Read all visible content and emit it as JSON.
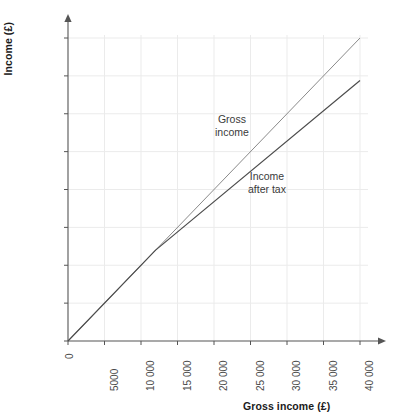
{
  "chart_data": {
    "type": "line",
    "title": "",
    "xlabel": "Gross income (£)",
    "ylabel": "Income (£)",
    "xlim": [
      0,
      40000
    ],
    "ylim": [
      0,
      40000
    ],
    "grid": true,
    "legend_position": "inline-annotation",
    "xticks": [
      0,
      5000,
      10000,
      15000,
      20000,
      25000,
      30000,
      35000,
      40000
    ],
    "xticklabels": [
      "0",
      "5000",
      "10 000",
      "15 000",
      "20 000",
      "25 000",
      "30 000",
      "35 000",
      "40 000"
    ],
    "yticks": [
      0,
      5000,
      10000,
      15000,
      20000,
      25000,
      30000,
      35000,
      40000
    ],
    "yticklabels": [
      "0",
      "5000",
      "10 000",
      "15 000",
      "20 000",
      "25 000",
      "30 000",
      "35 000",
      "40 000"
    ],
    "series": [
      {
        "name": "Gross income",
        "color": "#8a8a8a",
        "annotation": "Gross\nincome",
        "x": [
          0,
          40000
        ],
        "values": [
          0,
          40000
        ]
      },
      {
        "name": "Income after tax",
        "color": "#4d4d4d",
        "annotation": "Income\nafter tax",
        "x": [
          0,
          12000,
          40000
        ],
        "values": [
          0,
          12000,
          34400
        ]
      }
    ],
    "annotations": [
      {
        "text": "Gross\nincome",
        "x": 21000,
        "y": 26500
      },
      {
        "text": "Income\nafter tax",
        "x": 25500,
        "y": 20500
      }
    ],
    "axis_arrows": {
      "x": true,
      "y": true
    },
    "colors": {
      "gross_line": "#8a8a8a",
      "net_line": "#4d4d4d",
      "axis": "#555555",
      "grid": "#ebebeb",
      "tick_label": "#4a4a4a",
      "axis_title": "#1b1b1b",
      "background": "#ffffff"
    }
  }
}
